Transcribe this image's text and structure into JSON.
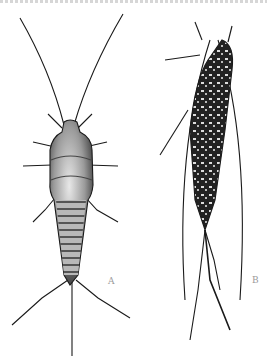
{
  "figure": {
    "panels": [
      {
        "label": "A",
        "view": "dorsal view, light stippled"
      },
      {
        "label": "B",
        "view": "dark mottled specimen, angled"
      }
    ],
    "colors": {
      "ink": "#1a1a1a",
      "background": "#ffffff",
      "label": "#9a9a9a"
    }
  }
}
